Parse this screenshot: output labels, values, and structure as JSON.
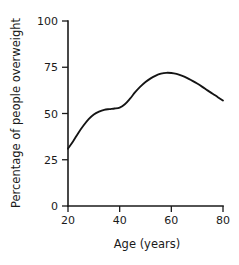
{
  "chart_data": {
    "type": "line",
    "title": "",
    "xlabel": "Age (years)",
    "ylabel": "Percentage of people overweight",
    "xlim": [
      20,
      80
    ],
    "ylim": [
      0,
      100
    ],
    "xticks": [
      20,
      40,
      60,
      80
    ],
    "yticks": [
      0,
      25,
      50,
      75,
      100
    ],
    "xticklabels": [
      "20",
      "40",
      "60",
      "80"
    ],
    "yticklabels": [
      "0",
      "25",
      "50",
      "75",
      "100"
    ],
    "grid": false,
    "legend": false,
    "line_color": "#141414",
    "background_color": "#ffffff",
    "series": [
      {
        "name": "Percentage of people overweight",
        "x": [
          20,
          22,
          24,
          26,
          28,
          30,
          32,
          34,
          36,
          38,
          40,
          42,
          44,
          46,
          48,
          50,
          52,
          54,
          56,
          58,
          60,
          62,
          64,
          66,
          68,
          70,
          72,
          74,
          76,
          78,
          80
        ],
        "values": [
          31,
          35,
          39.5,
          43.5,
          47,
          49.5,
          51,
          52,
          52.4,
          52.7,
          53.2,
          55,
          58,
          61.5,
          64.5,
          67,
          69,
          70.5,
          71.5,
          72,
          71.9,
          71.4,
          70.5,
          69.3,
          67.8,
          66.2,
          64.4,
          62.5,
          60.7,
          58.8,
          57
        ]
      }
    ],
    "annotations": {
      "start_value": "31",
      "plateau_value": "53",
      "peak_value": "72",
      "peak_age": "58",
      "end_value": "57"
    }
  }
}
